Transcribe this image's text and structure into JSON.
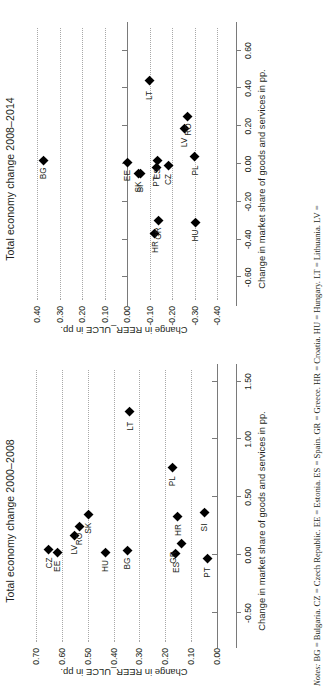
{
  "figure": {
    "notes_label": "Notes:",
    "notes_text": "BG = Bulgaria. CZ = Czech Republic. EE = Estonia. ES = Spain. GR = Greece. HR = Croatia. HU = Hungary. LT = Lithuania. LV ="
  },
  "chart_data": [
    {
      "type": "scatter",
      "title": "Total economy change 2000–2008",
      "xlabel": "Change in market share of goods and services in pp.",
      "ylabel": "Change in REER_ULCE in pp.",
      "xlim": [
        -0.75,
        1.6
      ],
      "ylim": [
        -0.02,
        0.74
      ],
      "xticks": [
        "-0.50",
        "0.00",
        "0.50",
        "1.00",
        "1.50"
      ],
      "xtickvals": [
        -0.5,
        0.0,
        0.5,
        1.0,
        1.5
      ],
      "yticks": [
        "0.00",
        "0.10",
        "0.20",
        "0.30",
        "0.40",
        "0.50",
        "0.60",
        "0.70"
      ],
      "ytickvals": [
        0.0,
        0.1,
        0.2,
        0.3,
        0.4,
        0.5,
        0.6,
        0.7
      ],
      "grid": "y-dotted",
      "legend": "none",
      "points": [
        {
          "label": "EE",
          "x": 0.02,
          "y": 0.62,
          "lp": "left"
        },
        {
          "label": "CZ",
          "x": 0.05,
          "y": 0.652,
          "lp": "left"
        },
        {
          "label": "LV",
          "x": 0.17,
          "y": 0.552,
          "lp": "left"
        },
        {
          "label": "RO",
          "x": 0.25,
          "y": 0.533,
          "lp": "left"
        },
        {
          "label": "SK",
          "x": 0.35,
          "y": 0.5,
          "lp": "left"
        },
        {
          "label": "HU",
          "x": 0.02,
          "y": 0.432,
          "lp": "left"
        },
        {
          "label": "BG",
          "x": 0.04,
          "y": 0.348,
          "lp": "left"
        },
        {
          "label": "LT",
          "x": 1.24,
          "y": 0.338,
          "lp": "left"
        },
        {
          "label": "PL",
          "x": 0.76,
          "y": 0.172,
          "lp": "left"
        },
        {
          "label": "HR",
          "x": 0.33,
          "y": 0.152,
          "lp": "left"
        },
        {
          "label": "ES",
          "x": 0.01,
          "y": 0.16,
          "lp": "left"
        },
        {
          "label": "GR",
          "x": 0.1,
          "y": 0.138,
          "lp": "above-left"
        },
        {
          "label": "SI",
          "x": 0.37,
          "y": 0.048,
          "lp": "left"
        },
        {
          "label": "PT",
          "x": -0.03,
          "y": 0.038,
          "lp": "left"
        }
      ]
    },
    {
      "type": "scatter",
      "title": "Total economy change 2008–2014",
      "xlabel": "Change in market share of goods and services in pp.",
      "ylabel": "Change in REER_ULCE in pp.",
      "xlim": [
        -0.72,
        0.72
      ],
      "ylim": [
        -0.42,
        0.45
      ],
      "xticks": [
        "-0.60",
        "-0.40",
        "-0.20",
        "0.00",
        "0.20",
        "0.40",
        "0.60"
      ],
      "xtickvals": [
        -0.6,
        -0.4,
        -0.2,
        0.0,
        0.2,
        0.4,
        0.6
      ],
      "yticks": [
        "-0.40",
        "-0.30",
        "-0.20",
        "-0.10",
        "0.00",
        "0.10",
        "0.20",
        "0.30",
        "0.40"
      ],
      "ytickvals": [
        -0.4,
        -0.3,
        -0.2,
        -0.1,
        0.0,
        0.1,
        0.2,
        0.3,
        0.4
      ],
      "grid": "y-dotted",
      "legend": "none",
      "points": [
        {
          "label": "BG",
          "x": 0.02,
          "y": 0.375,
          "lp": "left"
        },
        {
          "label": "EE",
          "x": 0.01,
          "y": 0.002,
          "lp": "left"
        },
        {
          "label": "LT",
          "x": 0.44,
          "y": -0.098,
          "lp": "left"
        },
        {
          "label": "LV",
          "x": 0.19,
          "y": -0.252,
          "lp": "left"
        },
        {
          "label": "RO",
          "x": 0.25,
          "y": -0.268,
          "lp": "left"
        },
        {
          "label": "SK",
          "x": -0.05,
          "y": -0.048,
          "lp": "left"
        },
        {
          "label": "PT",
          "x": -0.02,
          "y": -0.128,
          "lp": "left"
        },
        {
          "label": "ES",
          "x": 0.02,
          "y": -0.132,
          "lp": "left"
        },
        {
          "label": "CZ",
          "x": -0.01,
          "y": -0.182,
          "lp": "left"
        },
        {
          "label": "PL",
          "x": 0.04,
          "y": -0.298,
          "lp": "left"
        },
        {
          "label": "SI",
          "x": -0.05,
          "y": -0.058,
          "lp": "left"
        },
        {
          "label": "HR",
          "x": -0.37,
          "y": -0.122,
          "lp": "left"
        },
        {
          "label": "GR",
          "x": -0.3,
          "y": -0.136,
          "lp": "left"
        },
        {
          "label": "HU",
          "x": -0.31,
          "y": -0.3,
          "lp": "left"
        }
      ]
    }
  ]
}
